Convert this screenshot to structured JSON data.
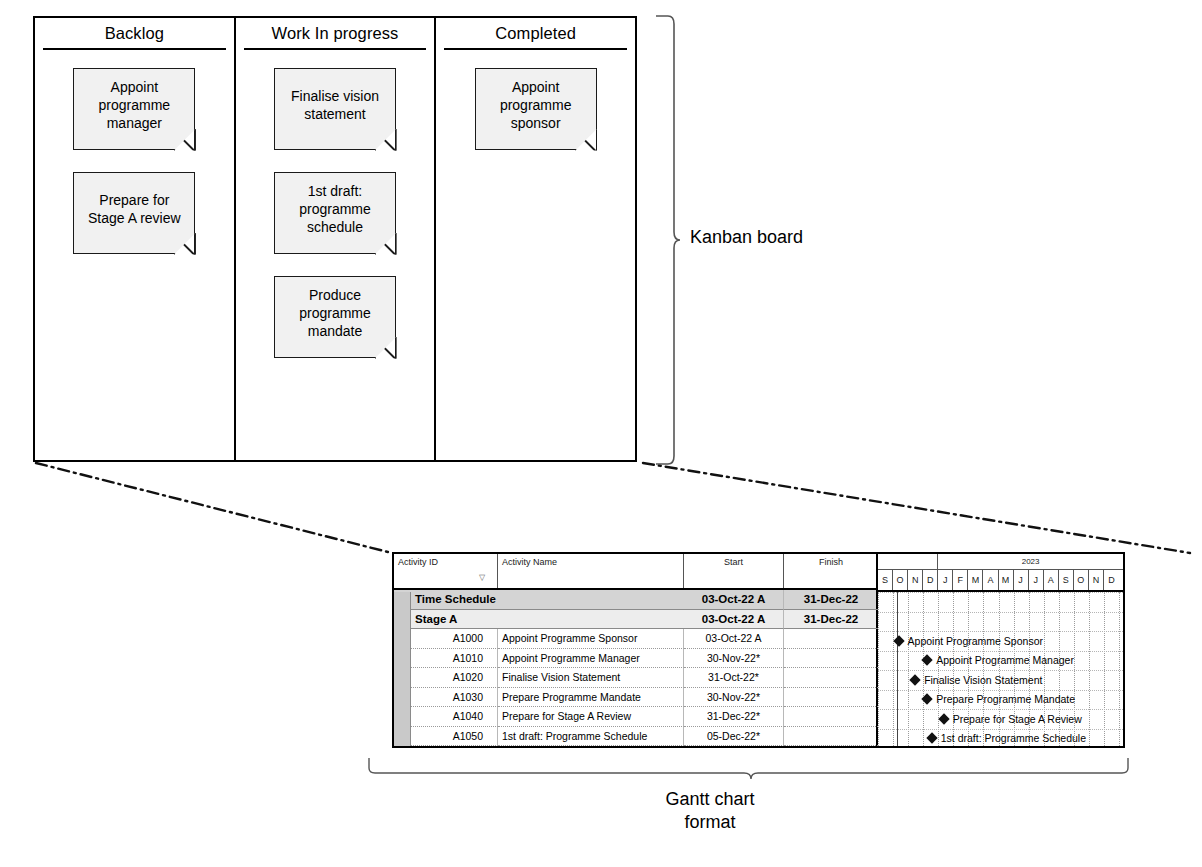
{
  "kanban": {
    "label": "Kanban board",
    "columns": [
      {
        "title": "Backlog",
        "cards": [
          {
            "text": "Appoint programme manager"
          },
          {
            "text": "Prepare for Stage A review"
          }
        ]
      },
      {
        "title": "Work In progress",
        "cards": [
          {
            "text": "Finalise vision statement"
          },
          {
            "text": "1st draft: programme schedule"
          },
          {
            "text": "Produce programme mandate"
          }
        ]
      },
      {
        "title": "Completed",
        "cards": [
          {
            "text": "Appoint programme sponsor"
          }
        ]
      }
    ]
  },
  "gantt": {
    "label_line1": "Gantt chart",
    "label_line2": "format",
    "columns": [
      "Activity ID",
      "Activity Name",
      "Start",
      "Finish"
    ],
    "sort_marker": "▽",
    "expander_symbol": "−",
    "rows": [
      {
        "level": 0,
        "id": "",
        "name": "Time Schedule",
        "start": "03-Oct-22 A",
        "finish": "31-Dec-22",
        "expandable": true
      },
      {
        "level": 1,
        "id": "",
        "name": "Stage A",
        "start": "03-Oct-22 A",
        "finish": "31-Dec-22",
        "expandable": true
      },
      {
        "level": 2,
        "id": "A1000",
        "name": "Appoint Programme Sponsor",
        "start": "03-Oct-22 A",
        "finish": "",
        "expandable": false
      },
      {
        "level": 2,
        "id": "A1010",
        "name": "Appoint Programme Manager",
        "start": "30-Nov-22*",
        "finish": "",
        "expandable": false
      },
      {
        "level": 2,
        "id": "A1020",
        "name": "Finalise Vision Statement",
        "start": "31-Oct-22*",
        "finish": "",
        "expandable": false
      },
      {
        "level": 2,
        "id": "A1030",
        "name": "Prepare Programme Mandate",
        "start": "30-Nov-22*",
        "finish": "",
        "expandable": false
      },
      {
        "level": 2,
        "id": "A1040",
        "name": "Prepare for Stage A Review",
        "start": "31-Dec-22*",
        "finish": "",
        "expandable": false
      },
      {
        "level": 2,
        "id": "A1050",
        "name": "1st draft: Programme Schedule",
        "start": "05-Dec-22*",
        "finish": "",
        "expandable": false
      }
    ],
    "timeline": {
      "year_label": "2023",
      "months": [
        "S",
        "O",
        "N",
        "D",
        "J",
        "F",
        "M",
        "A",
        "M",
        "J",
        "J",
        "A",
        "S",
        "O",
        "N",
        "D"
      ],
      "year_start_index": 4,
      "milestones": [
        {
          "label": "Appoint Programme Sponsor",
          "month_index": 1.1,
          "row": 2
        },
        {
          "label": "Appoint Programme Manager",
          "month_index": 3.0,
          "row": 3
        },
        {
          "label": "Finalise Vision Statement",
          "month_index": 2.2,
          "row": 4
        },
        {
          "label": "Prepare Programme Mandate",
          "month_index": 3.0,
          "row": 5
        },
        {
          "label": "Prepare for Stage A Review",
          "month_index": 4.1,
          "row": 6
        },
        {
          "label": "1st draft: Programme Schedule",
          "month_index": 3.3,
          "row": 7
        }
      ],
      "data_date_month_index": 1.25
    }
  },
  "colors": {
    "ink": "#000000",
    "note_fill": "#f1f1f1",
    "summary_level0": "#d4d4d4",
    "summary_level1": "#ededed",
    "gutter": "#c9c9c9"
  }
}
